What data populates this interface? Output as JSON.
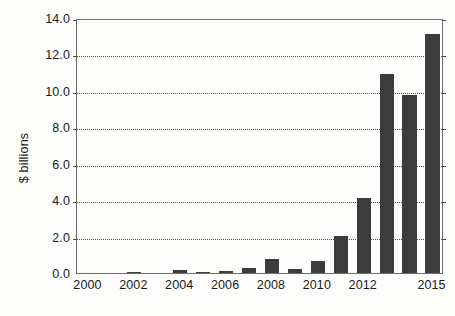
{
  "chart_data": {
    "type": "bar",
    "title": "",
    "subtitle": "",
    "xlabel": "",
    "ylabel": "$ billions",
    "categories": [
      "2000",
      "2001",
      "2002",
      "2003",
      "2004",
      "2005",
      "2006",
      "2007",
      "2008",
      "2009",
      "2010",
      "2011",
      "2012",
      "2013",
      "2014",
      "2015"
    ],
    "values": [
      0.0,
      0.0,
      0.08,
      0.0,
      0.15,
      0.07,
      0.1,
      0.3,
      0.75,
      0.2,
      0.65,
      2.05,
      4.1,
      10.9,
      9.8,
      13.1
    ],
    "series": [
      {
        "name": "",
        "values": [
          0.0,
          0.0,
          0.08,
          0.0,
          0.15,
          0.07,
          0.1,
          0.3,
          0.75,
          0.2,
          0.65,
          2.05,
          4.1,
          10.9,
          9.8,
          13.1
        ]
      }
    ],
    "ylim": [
      0.0,
      14.0
    ],
    "ytick_values": [
      0.0,
      2.0,
      4.0,
      6.0,
      8.0,
      10.0,
      12.0,
      14.0
    ],
    "ytick_labels": [
      "0.0",
      "2.0",
      "4.0",
      "6.0",
      "8.0",
      "10.0",
      "12.0",
      "14.0"
    ],
    "xtick_labels": [
      "2000",
      "2002",
      "2004",
      "2006",
      "2008",
      "2010",
      "2012",
      "2015"
    ],
    "xtick_categories": [
      "2000",
      "2002",
      "2004",
      "2006",
      "2008",
      "2010",
      "2012",
      "2015"
    ],
    "grid": "horizontal-dotted",
    "legend": "none",
    "bar_color": "#3c3c3c",
    "grid_color": "#4d4d4d",
    "frame_color": "#6e6e6e",
    "background_color": "#fdfdfc",
    "annotations": []
  }
}
